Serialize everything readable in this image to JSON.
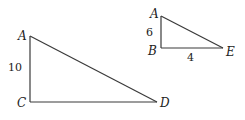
{
  "figure": {
    "triangle_large": {
      "vertices": {
        "top": "A",
        "right_angle": "C",
        "acute": "D"
      },
      "side_labels": {
        "AC": "10"
      }
    },
    "triangle_small": {
      "vertices": {
        "top": "A",
        "right_angle": "B",
        "acute": "E"
      },
      "side_labels": {
        "AB": "6",
        "BE": "4"
      }
    }
  }
}
